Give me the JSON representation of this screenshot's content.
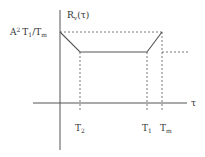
{
  "diagram": {
    "y_label": "R",
    "y_label_sub": "v",
    "y_label_arg": "(τ)",
    "x_label": "τ",
    "level_label": {
      "A": "A",
      "exp": "2",
      "T1": "T",
      "T1_sub": "1",
      "slash": "/T",
      "Tm_sub": "m"
    },
    "ticks": [
      {
        "name": "T",
        "sub": "2"
      },
      {
        "name": "T",
        "sub": "1"
      },
      {
        "name": "T",
        "sub": "m"
      }
    ],
    "line_color": "#555555"
  }
}
